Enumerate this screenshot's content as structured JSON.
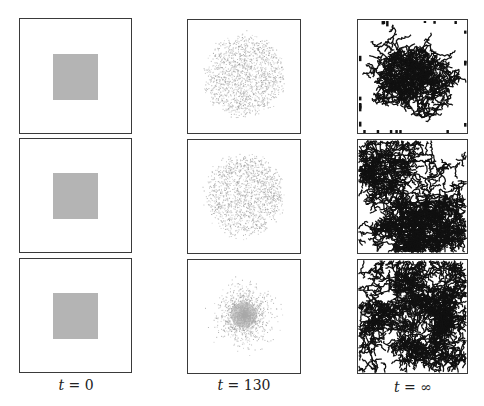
{
  "figure": {
    "columns": [
      {
        "label": "t = 0",
        "time": "0",
        "description": "initial uniform square of particles"
      },
      {
        "label": "t = 130",
        "time": "130",
        "description": "diffusing particle cloud"
      },
      {
        "label": "t = ∞",
        "time": "∞",
        "description": "aggregated dendritic clusters"
      }
    ],
    "rows": [
      {
        "row": 1,
        "cloud": "uniform",
        "cluster": "central seed"
      },
      {
        "row": 2,
        "cloud": "uniform",
        "cluster": "boundary seeded"
      },
      {
        "row": 3,
        "cloud": "centrally concentrated",
        "cluster": "boundary seeded"
      }
    ],
    "labels": {
      "col1_var": "t",
      "col1_eq": " = 0",
      "col2_var": "t",
      "col2_eq": " = 130",
      "col3_var": "t",
      "col3_eq": " = ∞"
    },
    "colors": {
      "frame": "#3a3a3a",
      "square": "#b4b4b4",
      "particles": "#9a9a9a",
      "cluster": "#111111"
    }
  }
}
